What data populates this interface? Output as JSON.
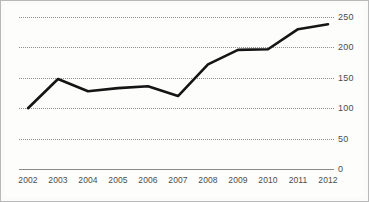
{
  "chart_data": {
    "type": "line",
    "title": "",
    "subtitle": "",
    "xlabel": "",
    "ylabel": "",
    "categories": [
      "2002",
      "2003",
      "2004",
      "2005",
      "2006",
      "2007",
      "2008",
      "2009",
      "2010",
      "2011",
      "2012"
    ],
    "x": [
      2002,
      2003,
      2004,
      2005,
      2006,
      2007,
      2008,
      2009,
      2010,
      2011,
      2012
    ],
    "values": [
      100,
      148,
      128,
      133,
      136,
      120,
      172,
      196,
      197,
      230,
      238
    ],
    "series": [
      {
        "name": "",
        "values": [
          100,
          148,
          128,
          133,
          136,
          120,
          172,
          196,
          197,
          230,
          238
        ]
      }
    ],
    "ylim": [
      0,
      250
    ],
    "yticks": [
      0,
      50,
      100,
      150,
      200,
      250
    ],
    "ytick_labels": [
      "0",
      "50",
      "100",
      "150",
      "200",
      "250"
    ],
    "xtick_labels": [
      "2002",
      "2003",
      "2004",
      "2005",
      "2006",
      "2007",
      "2008",
      "2009",
      "2010",
      "2011",
      "2012"
    ],
    "grid": true,
    "grid_style": "dotted",
    "grid_orientation": "horizontal",
    "legend": false,
    "legend_position": "none",
    "y_axis_side": "right",
    "markers": false,
    "annotations": [],
    "colors": {
      "line": "#151515",
      "grid": "#8e8e8e",
      "baseline": "#8a8a8a",
      "tick_text": "#4c4c4c",
      "background": "#fdfdfc",
      "frame_border": "#b9b9b9"
    }
  }
}
